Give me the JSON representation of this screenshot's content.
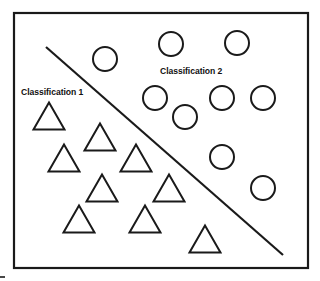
{
  "figure": {
    "title_visible": false,
    "background_color": "#ffffff",
    "stroke_color": "#1a1a1a",
    "frame": {
      "x": 14,
      "y": 13,
      "width": 294,
      "height": 255,
      "stroke_width": 2.2
    },
    "corner_artifact": {
      "x1": 0,
      "y1": 277,
      "x2": 5,
      "y2": 277
    }
  },
  "labels": {
    "class_1": "Classification 1",
    "class_2": "Classification 2"
  },
  "chart_data": {
    "type": "scatter",
    "title": "",
    "subtitle": "",
    "xlabel": "",
    "ylabel": "",
    "grid": false,
    "legend_position": "inline-annotation",
    "axis_visible": false,
    "xlim": [
      14,
      308
    ],
    "ylim": [
      13,
      268
    ],
    "annotations": [
      {
        "text": "Classification 1",
        "x": 28,
        "y": 94,
        "bold": true,
        "font_size": 8.6
      },
      {
        "text": "Classification 2",
        "x": 167,
        "y": 73,
        "bold": true,
        "font_size": 8.6
      }
    ],
    "decision_boundary": {
      "name": "linear-separator",
      "x1": 46,
      "y1": 47,
      "x2": 283,
      "y2": 255,
      "stroke_width": 2.2,
      "stroke": "#1a1a1a"
    },
    "series": [
      {
        "name": "Classification 1",
        "marker": "triangle",
        "marker_filled": false,
        "count": 10,
        "stroke_width": 2.0,
        "side": 31,
        "points": [
          {
            "cx": 49,
            "cy": 116
          },
          {
            "cx": 100,
            "cy": 137
          },
          {
            "cx": 64,
            "cy": 158
          },
          {
            "cx": 136,
            "cy": 158
          },
          {
            "cx": 102,
            "cy": 188
          },
          {
            "cx": 169,
            "cy": 188
          },
          {
            "cx": 79,
            "cy": 219
          },
          {
            "cx": 145,
            "cy": 219
          },
          {
            "cx": 205,
            "cy": 239
          },
          {
            "cx": 49,
            "cy": 116
          }
        ]
      },
      {
        "name": "Classification 2",
        "marker": "circle",
        "marker_filled": false,
        "count": 10,
        "stroke_width": 2.0,
        "radius": 12,
        "points": [
          {
            "cx": 105,
            "cy": 59
          },
          {
            "cx": 171,
            "cy": 44
          },
          {
            "cx": 237,
            "cy": 43
          },
          {
            "cx": 155,
            "cy": 98
          },
          {
            "cx": 185,
            "cy": 117
          },
          {
            "cx": 222,
            "cy": 98
          },
          {
            "cx": 263,
            "cy": 98
          },
          {
            "cx": 222,
            "cy": 157
          },
          {
            "cx": 263,
            "cy": 188
          },
          {
            "cx": 105,
            "cy": 59
          }
        ]
      }
    ]
  }
}
